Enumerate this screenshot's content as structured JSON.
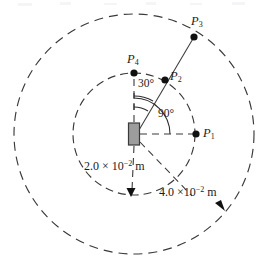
{
  "figure": {
    "kind": "physics-diagram",
    "center": {
      "x": 134,
      "y": 134
    },
    "magnet": {
      "x": 134,
      "y": 134,
      "width": 11,
      "height": 22,
      "fill": "#9d9d9d",
      "stroke": "#3a3a3a"
    },
    "circles": [
      {
        "name": "inner-circle",
        "radius": 61,
        "style": "dashed",
        "stroke": "#3a3a3a"
      },
      {
        "name": "outer-circle",
        "radius": 120,
        "style": "dashed",
        "stroke": "#3a3a3a"
      }
    ],
    "points": [
      {
        "id": "P1",
        "label": "P",
        "sub": "1",
        "x": 196,
        "y": 134,
        "label_x": 203,
        "label_y": 127
      },
      {
        "id": "P2",
        "label": "P",
        "sub": "2",
        "x": 165,
        "y": 80,
        "label_x": 170,
        "label_y": 70
      },
      {
        "id": "P3",
        "label": "P",
        "sub": "3",
        "x": 194,
        "y": 37,
        "label_x": 191,
        "label_y": 15
      },
      {
        "id": "P4",
        "label": "P",
        "sub": "4",
        "x": 134,
        "y": 73,
        "label_x": 127,
        "label_y": 53
      }
    ],
    "angles": [
      {
        "name": "angle-30",
        "text": "30°",
        "value": 30,
        "unit": "degree",
        "label_x": 138,
        "label_y": 78
      },
      {
        "name": "angle-90",
        "text": "90°",
        "value": 90,
        "unit": "degree",
        "label_x": 158,
        "label_y": 108
      }
    ],
    "dimensions": [
      {
        "name": "inner-radius-label",
        "prefix": "2.0 × 10",
        "exponent": "−2",
        "suffix": " m",
        "value": 0.02,
        "label_x": 84,
        "label_y": 160
      },
      {
        "name": "outer-radius-label",
        "prefix": "4.0 ×10",
        "exponent": "−2",
        "suffix": " m",
        "value": 0.04,
        "label_x": 159,
        "label_y": 186
      }
    ],
    "arrowheads": [
      {
        "name": "inner-circle-arrowhead",
        "x": 131,
        "y": 194,
        "rotation": 170
      },
      {
        "name": "outer-circle-arrowhead",
        "x": 221,
        "y": 206,
        "rotation": 128
      }
    ],
    "colors": {
      "ink": "#1b1b1b",
      "line": "#3a3a3a",
      "magnet_fill": "#9d9d9d",
      "background": "#ffffff"
    }
  }
}
